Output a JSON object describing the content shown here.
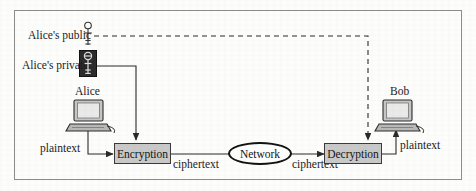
{
  "diagram": {
    "frame": {
      "visible": true,
      "border_color": "#8d8d8d"
    },
    "labels": {
      "alice_public": "Alice's public",
      "alice_private": "Alice's private",
      "alice": "Alice",
      "bob": "Bob",
      "plaintext_left": "plaintext",
      "plaintext_right": "plaintext",
      "ciphertext_left": "ciphertext",
      "ciphertext_right": "ciphertext"
    },
    "nodes": {
      "encryption": "Encryption",
      "decryption": "Decryption",
      "network": "Network"
    },
    "icons": {
      "public_key": "key-icon",
      "private_key": "key-icon-dark",
      "alice_computer": "desktop-computer-icon",
      "bob_computer": "desktop-computer-icon"
    },
    "colors": {
      "process_fill": "#c9c9c9",
      "process_stroke": "#3a3a3a",
      "line": "#2a2a2a",
      "dashed_line": "#2a2a2a",
      "private_key_bg": "#2b2b2b",
      "frame_border": "#8d8d8d",
      "text": "#1b1b1b"
    },
    "edges": [
      {
        "from": "alice-public-key",
        "to": "decryption",
        "style": "dashed"
      },
      {
        "from": "alice-private-key",
        "to": "encryption",
        "style": "solid"
      },
      {
        "from": "alice-computer",
        "to": "encryption",
        "style": "solid-arrow",
        "label": "plaintext"
      },
      {
        "from": "encryption",
        "to": "network",
        "style": "solid",
        "label": "ciphertext"
      },
      {
        "from": "network",
        "to": "decryption",
        "style": "solid-arrow",
        "label": "ciphertext"
      },
      {
        "from": "decryption",
        "to": "bob-computer",
        "style": "solid-arrow",
        "label": "plaintext"
      }
    ]
  }
}
